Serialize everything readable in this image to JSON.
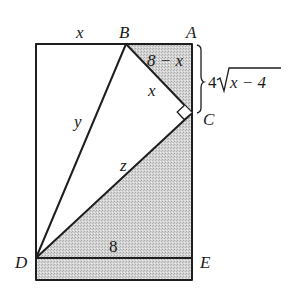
{
  "figure": {
    "type": "geometry-diagram",
    "colors": {
      "line": "#1e1e1e",
      "shade": "#c6c6c6",
      "background": "#ffffff"
    },
    "points": {
      "A": {
        "label": "A",
        "x": 192,
        "y": 44
      },
      "B": {
        "label": "B",
        "x": 126,
        "y": 44
      },
      "C": {
        "label": "C",
        "x": 192,
        "y": 113
      },
      "D": {
        "label": "D",
        "x": 36,
        "y": 258
      },
      "E": {
        "label": "E",
        "x": 192,
        "y": 258
      }
    },
    "segment_labels": {
      "top_left": "x",
      "BA": "8 − x",
      "BC": "x",
      "BD": "y",
      "DC": "z",
      "DE": "8",
      "AC_brace": "4",
      "AC_brace_radicand": "x − 4"
    },
    "marks": {
      "right_angle_at": "C"
    }
  }
}
